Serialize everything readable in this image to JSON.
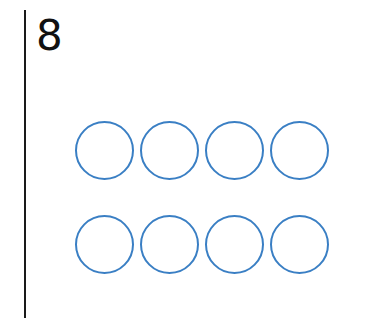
{
  "number": "8",
  "circles": {
    "count": 8,
    "rows": 2,
    "columns": 4,
    "stroke_color": "#3a7fc4",
    "filled": 0
  }
}
